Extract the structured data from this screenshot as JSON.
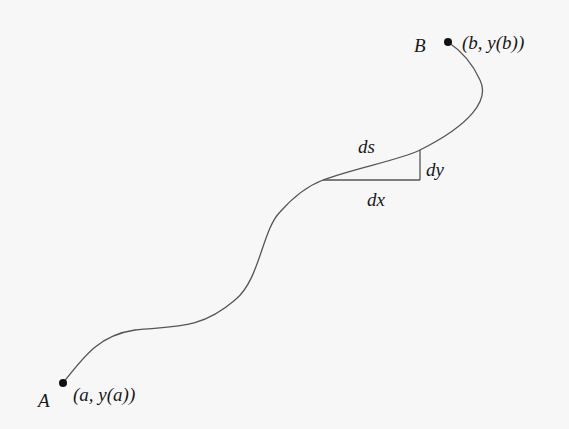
{
  "figure": {
    "type": "arc-length-diagram",
    "colors": {
      "background": "#f7f7f7",
      "curve": "#555555",
      "point": "#111111",
      "text": "#1a1a1a"
    },
    "points": {
      "start": {
        "name": "A",
        "coord_label": "(a, y(a))"
      },
      "end": {
        "name": "B",
        "coord_label": "(b, y(b))"
      }
    },
    "differential_triangle": {
      "hypotenuse_label": "ds",
      "vertical_label": "dy",
      "horizontal_label": "dx"
    }
  }
}
